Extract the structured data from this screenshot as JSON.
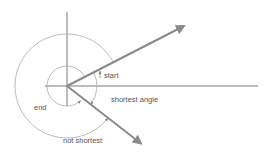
{
  "diagram": {
    "width": 270,
    "height": 155,
    "colors": {
      "axis": "#7a7a7a",
      "vector": "#8a8a8a",
      "arc": "#a8a8a8",
      "text": "#555555"
    },
    "origin": {
      "x": 67,
      "y": 86
    },
    "axes": {
      "vertical": {
        "x": 67,
        "y1": 12,
        "y2": 106
      },
      "horizontal": {
        "y": 86,
        "x1": 45,
        "x2": 258
      }
    },
    "vectors": [
      {
        "name": "start-vector",
        "x1": 67,
        "y1": 86,
        "x2": 186,
        "y2": 25
      },
      {
        "name": "end-vector",
        "x1": 67,
        "y1": 86,
        "x2": 143,
        "y2": 145
      }
    ],
    "arcs": [
      {
        "name": "shortest-angle-arc",
        "radius": 30
      },
      {
        "name": "end-inner-arc",
        "radius": 20
      },
      {
        "name": "not-shortest-outer-arc",
        "radius": 52
      }
    ],
    "labels": {
      "start": "start",
      "shortest_angle": "shortest angle",
      "end": "end",
      "not_shortest": "not shortest"
    }
  }
}
